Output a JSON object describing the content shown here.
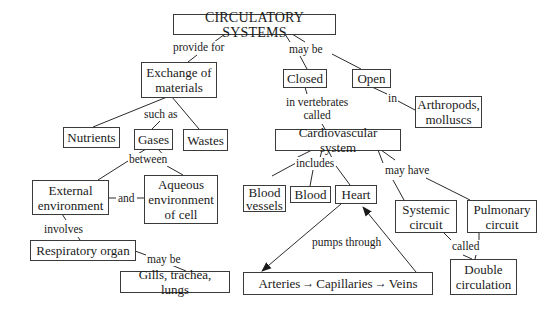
{
  "diagram": {
    "type": "concept-map",
    "title": "CIRCULATORY SYSTEMS",
    "nodes": {
      "root": "CIRCULATORY SYSTEMS",
      "exchange": "Exchange of\nmaterials",
      "closed": "Closed",
      "open": "Open",
      "arthropods": "Arthropods,\nmolluscs",
      "nutrients": "Nutrients",
      "gases": "Gases",
      "wastes": "Wastes",
      "cardio": "Cardiovascular system",
      "external": "External\nenvironment",
      "aqueous": "Aqueous\nenvironment\nof cell",
      "blood_vessels": "Blood\nvessels",
      "blood": "Blood",
      "heart": "Heart",
      "systemic": "Systemic\ncircuit",
      "pulmonary": "Pulmonary\ncircuit",
      "respiratory": "Respiratory organ",
      "gills": "Gills, trachea, lungs",
      "arteries": "Arteries",
      "capillaries": "Capillaries",
      "veins": "Veins",
      "double": "Double\ncirculation"
    },
    "links": {
      "provide_for": "provide for",
      "may_be_1": "may be",
      "in": "in",
      "in_vertebrates_called": "in vertebrates\ncalled",
      "such_as": "such as",
      "between": "between",
      "and": "and",
      "involves": "involves",
      "may_be_2": "may be",
      "includes": "includes",
      "may_have": "may have",
      "pumps_through": "pumps through",
      "called": "called"
    },
    "flow_arrow": "→",
    "colors": {
      "line": "#2a2a2a",
      "border": "#3a3a3a",
      "text": "#1a1a1a",
      "background": "#ffffff"
    }
  }
}
